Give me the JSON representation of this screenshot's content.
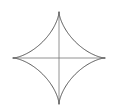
{
  "diagram": {
    "type": "astroid",
    "center": [
      59,
      58
    ],
    "radius_x": 46,
    "radius_y": 46,
    "stroke_color": "#555555",
    "axis_color": "#777777",
    "background": "#ffffff"
  }
}
